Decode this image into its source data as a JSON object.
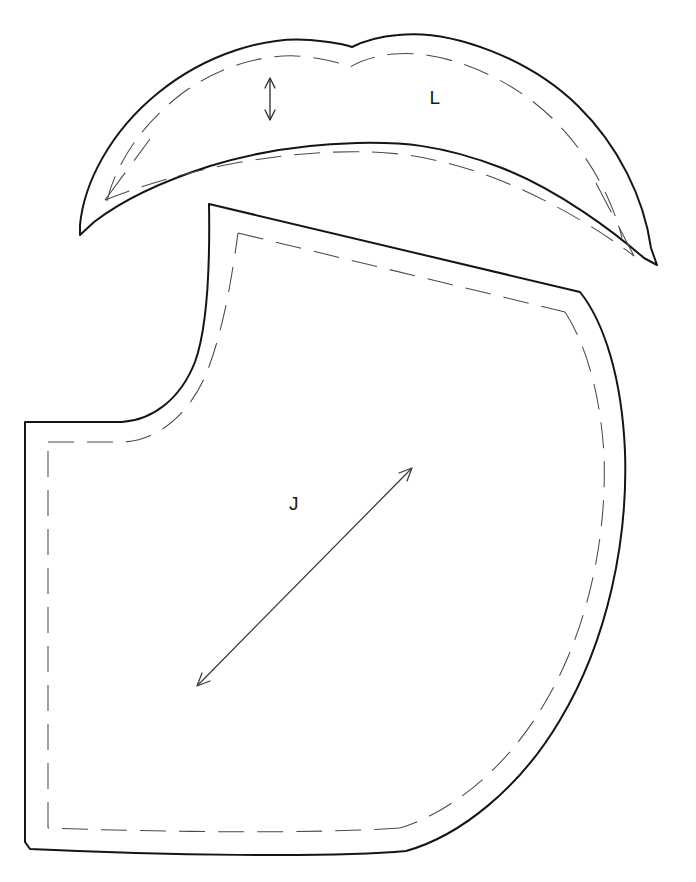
{
  "sheet": {
    "title": "Sewing Pattern Sheet",
    "background_color": "#ffffff",
    "cut_line_color": "#151515",
    "seam_line_color": "#4a4a4a",
    "width": 696,
    "height": 882
  },
  "pieces": [
    {
      "id": "L",
      "label": "L",
      "name": "upper-collar-piece",
      "label_x": 435,
      "label_y": 104,
      "markings": [
        {
          "type": "double-arrow",
          "name": "fold-depth-arrow",
          "orientation": "vertical",
          "x": 270,
          "y_start": 78,
          "y_end": 120
        }
      ],
      "has_seam_allowance": true
    },
    {
      "id": "J",
      "label": "J",
      "name": "main-body-piece",
      "label_x": 294,
      "label_y": 510,
      "markings": [
        {
          "type": "double-arrow",
          "name": "grainline-arrow",
          "orientation": "diagonal",
          "x_start": 197,
          "y_start": 686,
          "x_end": 412,
          "y_end": 468
        }
      ],
      "has_seam_allowance": true
    }
  ],
  "legend": {
    "cut_line_name": "cutting-line",
    "seam_line_name": "seam-allowance-line",
    "grainline_name": "grainline"
  }
}
